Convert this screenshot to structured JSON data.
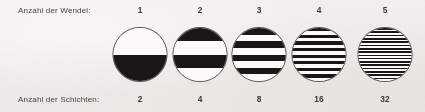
{
  "figure": {
    "background_color": "#f2f0ec",
    "ink_color": "#191713",
    "outline_color": "#55524d"
  },
  "rows": {
    "top_label": "Anzahl der Wendel:",
    "bottom_label": "Anzahl der Schichten:"
  },
  "columns": [
    {
      "coil_count": "1",
      "layer_count": "2",
      "layers": 2,
      "first_band": "light",
      "center_x": 140,
      "diameter": 55
    },
    {
      "coil_count": "2",
      "layer_count": "4",
      "layers": 4,
      "first_band": "dark",
      "center_x": 200,
      "diameter": 55
    },
    {
      "coil_count": "3",
      "layer_count": "8",
      "layers": 8,
      "first_band": "dark",
      "center_x": 259,
      "diameter": 55
    },
    {
      "coil_count": "4",
      "layer_count": "16",
      "layers": 16,
      "first_band": "dark",
      "center_x": 319,
      "diameter": 55
    },
    {
      "coil_count": "5",
      "layer_count": "32",
      "layers": 32,
      "first_band": "dark",
      "center_x": 385,
      "diameter": 55
    }
  ]
}
